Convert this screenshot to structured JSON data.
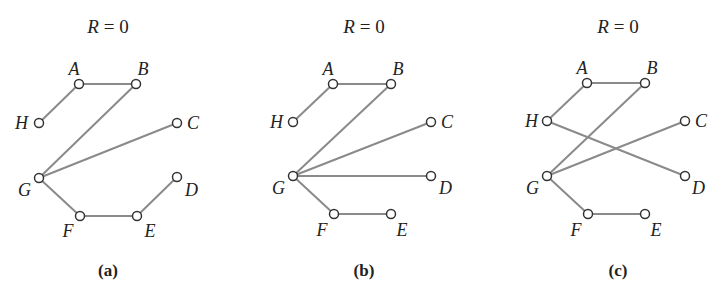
{
  "colors": {
    "edge": "#8a8a8a",
    "node_stroke": "#333333",
    "text": "#222222",
    "background": "#ffffff"
  },
  "panels": [
    {
      "id": "a",
      "title_var": "R",
      "title_rest": " = 0",
      "caption": "(a)",
      "center_x": 108,
      "nodes": [
        {
          "id": "A",
          "x": 79,
          "y": 84,
          "lx": 74,
          "ly": 75,
          "anchor": "middle"
        },
        {
          "id": "B",
          "x": 136,
          "y": 84,
          "lx": 143,
          "ly": 75,
          "anchor": "middle"
        },
        {
          "id": "H",
          "x": 39,
          "y": 123,
          "lx": 28,
          "ly": 129,
          "anchor": "end"
        },
        {
          "id": "C",
          "x": 177,
          "y": 123,
          "lx": 187,
          "ly": 129,
          "anchor": "start"
        },
        {
          "id": "G",
          "x": 39,
          "y": 178,
          "lx": 31,
          "ly": 196,
          "anchor": "end"
        },
        {
          "id": "D",
          "x": 177,
          "y": 177,
          "lx": 185,
          "ly": 196,
          "anchor": "start"
        },
        {
          "id": "F",
          "x": 80,
          "y": 216,
          "lx": 68,
          "ly": 237,
          "anchor": "middle"
        },
        {
          "id": "E",
          "x": 137,
          "y": 216,
          "lx": 150,
          "ly": 237,
          "anchor": "middle"
        }
      ],
      "edges": [
        [
          "H",
          "A"
        ],
        [
          "A",
          "B"
        ],
        [
          "B",
          "G"
        ],
        [
          "C",
          "G"
        ],
        [
          "G",
          "F"
        ],
        [
          "F",
          "E"
        ],
        [
          "E",
          "D"
        ]
      ]
    },
    {
      "id": "b",
      "title_var": "R",
      "title_rest": " = 0",
      "caption": "(b)",
      "center_x": 364,
      "nodes": [
        {
          "id": "A",
          "x": 333,
          "y": 84,
          "lx": 328,
          "ly": 75,
          "anchor": "middle"
        },
        {
          "id": "B",
          "x": 391,
          "y": 84,
          "lx": 398,
          "ly": 75,
          "anchor": "middle"
        },
        {
          "id": "H",
          "x": 293,
          "y": 122,
          "lx": 283,
          "ly": 128,
          "anchor": "end"
        },
        {
          "id": "C",
          "x": 431,
          "y": 122,
          "lx": 441,
          "ly": 128,
          "anchor": "start"
        },
        {
          "id": "G",
          "x": 293,
          "y": 176,
          "lx": 285,
          "ly": 194,
          "anchor": "end"
        },
        {
          "id": "D",
          "x": 431,
          "y": 176,
          "lx": 439,
          "ly": 194,
          "anchor": "start"
        },
        {
          "id": "F",
          "x": 334,
          "y": 214,
          "lx": 322,
          "ly": 236,
          "anchor": "middle"
        },
        {
          "id": "E",
          "x": 391,
          "y": 214,
          "lx": 402,
          "ly": 236,
          "anchor": "middle"
        }
      ],
      "edges": [
        [
          "H",
          "A"
        ],
        [
          "A",
          "B"
        ],
        [
          "B",
          "G"
        ],
        [
          "C",
          "G"
        ],
        [
          "D",
          "G"
        ],
        [
          "G",
          "F"
        ],
        [
          "F",
          "E"
        ]
      ]
    },
    {
      "id": "c",
      "title_var": "R",
      "title_rest": " = 0",
      "caption": "(c)",
      "center_x": 618,
      "nodes": [
        {
          "id": "A",
          "x": 587,
          "y": 83,
          "lx": 582,
          "ly": 74,
          "anchor": "middle"
        },
        {
          "id": "B",
          "x": 645,
          "y": 83,
          "lx": 652,
          "ly": 74,
          "anchor": "middle"
        },
        {
          "id": "H",
          "x": 547,
          "y": 121,
          "lx": 538,
          "ly": 127,
          "anchor": "end"
        },
        {
          "id": "C",
          "x": 685,
          "y": 121,
          "lx": 695,
          "ly": 127,
          "anchor": "start"
        },
        {
          "id": "G",
          "x": 547,
          "y": 176,
          "lx": 539,
          "ly": 194,
          "anchor": "end"
        },
        {
          "id": "D",
          "x": 685,
          "y": 176,
          "lx": 692,
          "ly": 194,
          "anchor": "start"
        },
        {
          "id": "F",
          "x": 588,
          "y": 214,
          "lx": 576,
          "ly": 236,
          "anchor": "middle"
        },
        {
          "id": "E",
          "x": 645,
          "y": 214,
          "lx": 656,
          "ly": 236,
          "anchor": "middle"
        }
      ],
      "edges": [
        [
          "H",
          "A"
        ],
        [
          "A",
          "B"
        ],
        [
          "B",
          "G"
        ],
        [
          "C",
          "G"
        ],
        [
          "H",
          "D"
        ],
        [
          "G",
          "F"
        ],
        [
          "F",
          "E"
        ]
      ]
    }
  ]
}
